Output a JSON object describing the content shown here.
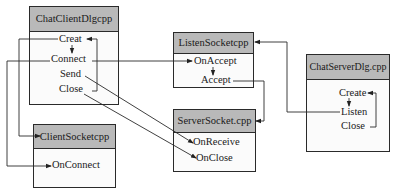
{
  "diagram": {
    "boxes": {
      "chat_client_dlg": {
        "title": "ChatClientDlgcpp",
        "methods": [
          "Creat",
          "Connect",
          "Send",
          "Close"
        ]
      },
      "client_socket": {
        "title": "ClientSocketcpp",
        "methods": [
          "OnConnect"
        ]
      },
      "listen_socket": {
        "title": "ListenSocketcpp",
        "methods": [
          "OnAccept",
          "Accept"
        ]
      },
      "server_socket": {
        "title": "ServerSocket.cpp",
        "methods": [
          "OnReceive",
          "OnClose"
        ]
      },
      "chat_server_dlg": {
        "title": "ChatServerDlg.cpp",
        "methods": [
          "Create",
          "Listen",
          "Close"
        ]
      }
    },
    "connections": [
      {
        "from": "ChatClientDlgcpp.Close",
        "to": "ChatClientDlgcpp.Creat"
      },
      {
        "from": "ChatClientDlgcpp.Creat",
        "to": "ChatClientDlgcpp.Connect"
      },
      {
        "from": "ChatClientDlgcpp.Creat",
        "to": "ClientSocketcpp"
      },
      {
        "from": "ChatClientDlgcpp.Connect",
        "to": "ClientSocketcpp.OnConnect"
      },
      {
        "from": "ChatClientDlgcpp.Connect",
        "to": "ListenSocketcpp.OnAccept"
      },
      {
        "from": "ChatClientDlgcpp.Send",
        "to": "ServerSocket.cpp.OnReceive"
      },
      {
        "from": "ChatClientDlgcpp.Close",
        "to": "ServerSocket.cpp.OnClose"
      },
      {
        "from": "ListenSocketcpp.OnAccept",
        "to": "ListenSocketcpp.Accept"
      },
      {
        "from": "ListenSocketcpp.Accept",
        "to": "ServerSocket.cpp"
      },
      {
        "from": "ChatServerDlg.cpp.Listen",
        "to": "ListenSocketcpp"
      },
      {
        "from": "ChatServerDlg.cpp.Create",
        "to": "ChatServerDlg.cpp.Listen"
      },
      {
        "from": "ChatServerDlg.cpp.Close",
        "to": "ChatServerDlg.cpp.Create"
      }
    ]
  }
}
